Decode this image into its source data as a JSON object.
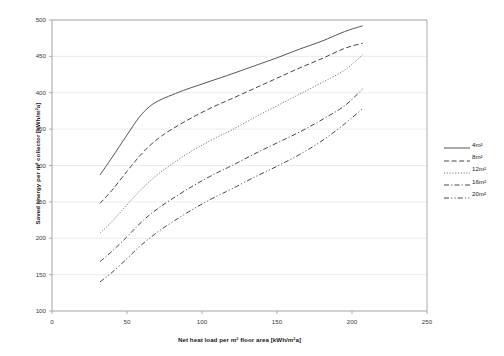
{
  "chart_data": {
    "type": "line",
    "title": "",
    "xlabel": "Net heat load per m² floor area [kWh/m²a]",
    "ylabel": "Saved energy per m² collector [kWh/m²a]",
    "xlim": [
      0,
      250
    ],
    "ylim": [
      100,
      500
    ],
    "xticks": [
      0,
      50,
      100,
      150,
      200,
      250
    ],
    "yticks": [
      100,
      150,
      200,
      250,
      300,
      350,
      400,
      450,
      500
    ],
    "grid": true,
    "legend_position": "right",
    "series": [
      {
        "name": "4m²",
        "style": "solid",
        "color": "#4d4d4d",
        "x": [
          32,
          40,
          50,
          58,
          65,
          72,
          80,
          90,
          100,
          110,
          120,
          135,
          150,
          165,
          180,
          195,
          207
        ],
        "y": [
          287,
          311,
          342,
          366,
          381,
          390,
          397,
          405,
          412,
          419,
          426,
          437,
          448,
          460,
          471,
          484,
          492
        ]
      },
      {
        "name": "8m²",
        "style": "dashed",
        "color": "#3d3d3d",
        "x": [
          32,
          40,
          50,
          58,
          65,
          72,
          80,
          90,
          100,
          110,
          120,
          135,
          150,
          165,
          180,
          195,
          207
        ],
        "y": [
          248,
          266,
          292,
          312,
          327,
          339,
          350,
          362,
          373,
          383,
          392,
          406,
          420,
          434,
          447,
          461,
          468
        ]
      },
      {
        "name": "12m²",
        "style": "dotted",
        "color": "#6a6a6a",
        "x": [
          32,
          40,
          50,
          58,
          65,
          72,
          80,
          90,
          100,
          110,
          120,
          135,
          150,
          165,
          180,
          195,
          207
        ],
        "y": [
          207,
          223,
          246,
          264,
          278,
          290,
          302,
          316,
          328,
          339,
          349,
          366,
          382,
          398,
          414,
          431,
          452
        ]
      },
      {
        "name": "16m²",
        "style": "dashdot",
        "color": "#3d3d3d",
        "x": [
          32,
          40,
          50,
          58,
          65,
          72,
          80,
          90,
          100,
          110,
          120,
          135,
          150,
          165,
          180,
          195,
          207
        ],
        "y": [
          168,
          182,
          202,
          219,
          232,
          243,
          254,
          267,
          279,
          290,
          300,
          316,
          331,
          346,
          363,
          382,
          405
        ]
      },
      {
        "name": "20m²",
        "style": "dashdotdot",
        "color": "#3d3d3d",
        "x": [
          32,
          40,
          50,
          58,
          65,
          72,
          80,
          90,
          100,
          110,
          120,
          135,
          150,
          165,
          180,
          195,
          207
        ],
        "y": [
          140,
          153,
          172,
          188,
          200,
          211,
          222,
          235,
          247,
          258,
          268,
          284,
          299,
          315,
          334,
          357,
          378
        ]
      }
    ]
  },
  "plot_area": {
    "left": 52,
    "top": 20,
    "right": 427,
    "bottom": 311
  },
  "colors": {
    "axis": "#9a9a9a",
    "grid": "#e4e4e4",
    "text": "#1a1a1a",
    "tick_text": "#3a3a3a",
    "background": "#ffffff"
  }
}
